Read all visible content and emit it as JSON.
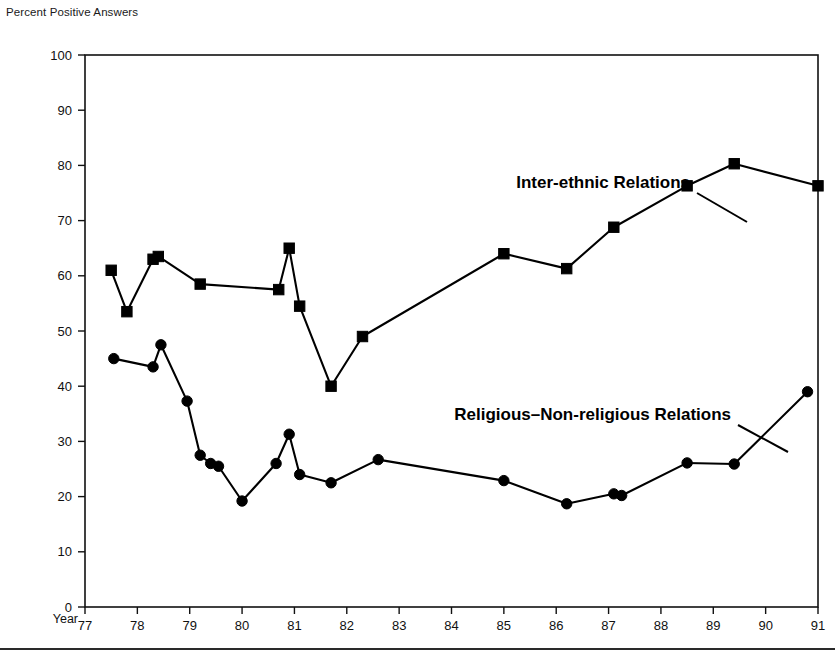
{
  "figure": {
    "title": "Percent Positive Answers",
    "x_axis_name": "Year"
  },
  "chart_data": {
    "type": "line",
    "title": "Percent Positive Answers",
    "xlabel": "Year",
    "ylabel": "Percent Positive Answers",
    "xlim": [
      77,
      91
    ],
    "ylim": [
      0,
      100
    ],
    "grid": false,
    "legend_position": "inline-annotation",
    "xticks": [
      "77",
      "78",
      "79",
      "80",
      "81",
      "82",
      "83",
      "84",
      "85",
      "86",
      "87",
      "88",
      "89",
      "90",
      "91"
    ],
    "yticks": [
      "0",
      "10",
      "20",
      "30",
      "40",
      "50",
      "60",
      "70",
      "80",
      "90",
      "100"
    ],
    "series": [
      {
        "name": "Inter-ethnic Relations",
        "marker": "square",
        "points": [
          {
            "x": 77.5,
            "y": 61.0
          },
          {
            "x": 77.8,
            "y": 53.5
          },
          {
            "x": 78.3,
            "y": 63.0
          },
          {
            "x": 78.4,
            "y": 63.5
          },
          {
            "x": 79.2,
            "y": 58.5
          },
          {
            "x": 80.7,
            "y": 57.5
          },
          {
            "x": 80.9,
            "y": 65.0
          },
          {
            "x": 81.1,
            "y": 54.5
          },
          {
            "x": 81.7,
            "y": 40.0
          },
          {
            "x": 82.3,
            "y": 49.0
          },
          {
            "x": 85.0,
            "y": 64.0
          },
          {
            "x": 86.2,
            "y": 61.3
          },
          {
            "x": 87.1,
            "y": 68.8
          },
          {
            "x": 88.5,
            "y": 76.3
          },
          {
            "x": 89.4,
            "y": 80.3
          },
          {
            "x": 91.0,
            "y": 76.3
          }
        ]
      },
      {
        "name": "Religious–Non-religious Relations",
        "marker": "circle",
        "points": [
          {
            "x": 77.55,
            "y": 45.0
          },
          {
            "x": 78.3,
            "y": 43.5
          },
          {
            "x": 78.45,
            "y": 47.5
          },
          {
            "x": 78.95,
            "y": 37.3
          },
          {
            "x": 79.2,
            "y": 27.5
          },
          {
            "x": 79.4,
            "y": 26.0
          },
          {
            "x": 79.55,
            "y": 25.5
          },
          {
            "x": 80.0,
            "y": 19.2
          },
          {
            "x": 80.65,
            "y": 26.0
          },
          {
            "x": 80.9,
            "y": 31.3
          },
          {
            "x": 81.1,
            "y": 24.0
          },
          {
            "x": 81.7,
            "y": 22.5
          },
          {
            "x": 82.6,
            "y": 26.7
          },
          {
            "x": 85.0,
            "y": 22.9
          },
          {
            "x": 86.2,
            "y": 18.7
          },
          {
            "x": 87.1,
            "y": 20.5
          },
          {
            "x": 87.25,
            "y": 20.2
          },
          {
            "x": 88.5,
            "y": 26.1
          },
          {
            "x": 89.4,
            "y": 25.9
          },
          {
            "x": 90.8,
            "y": 39.0
          }
        ]
      }
    ],
    "annotations": [
      {
        "text": "Inter-ethnic Relations",
        "text_x": 690,
        "text_y": 188,
        "anchor": "end",
        "leader_from": [
          697,
          193
        ],
        "leader_to": [
          747,
          222
        ]
      },
      {
        "text": "Religious–Non-religious Relations",
        "text_x": 731,
        "text_y": 420,
        "anchor": "end",
        "leader_from": [
          738,
          425
        ],
        "leader_to": [
          788,
          452
        ]
      }
    ]
  }
}
